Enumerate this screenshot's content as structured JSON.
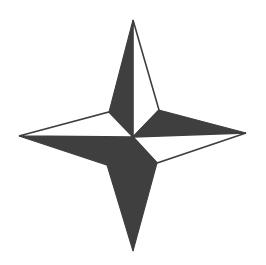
{
  "figure": {
    "title": "Four-Pointed Compass Star",
    "background_color": "#ffffff",
    "ink_color": "#3f3f3f",
    "outline_color": "#3f3f3f",
    "highlight_color": "#ffffff",
    "canvas": {
      "width": 266,
      "height": 265
    }
  },
  "geometry": {
    "center": {
      "x": 133,
      "y": 137
    },
    "points": 4,
    "tips": [
      {
        "name": "north",
        "x": 133,
        "y": 20,
        "label": "N"
      },
      {
        "name": "east",
        "x": 246,
        "y": 133,
        "label": "E"
      },
      {
        "name": "south",
        "x": 133,
        "y": 251,
        "label": "S"
      },
      {
        "name": "west",
        "x": 19,
        "y": 136,
        "label": "W"
      }
    ],
    "inner_vertices": [
      {
        "name": "northeast",
        "x": 159,
        "y": 110
      },
      {
        "name": "southeast",
        "x": 157,
        "y": 163
      },
      {
        "name": "southwest",
        "x": 107,
        "y": 165
      },
      {
        "name": "northwest",
        "x": 109,
        "y": 112
      }
    ],
    "facets": [
      {
        "arm": "north",
        "side": "west",
        "fill": "dark",
        "path": "M 133 20 L 109 112 L 133 137 Z"
      },
      {
        "arm": "north",
        "side": "east",
        "fill": "light",
        "path": "M 133 20 L 133 137 L 159 110 Z"
      },
      {
        "arm": "east",
        "side": "north",
        "fill": "dark",
        "path": "M 246 133 L 159 110 L 133 137 Z"
      },
      {
        "arm": "east",
        "side": "south",
        "fill": "light",
        "path": "M 246 133 L 133 137 L 157 163 Z"
      },
      {
        "arm": "south",
        "side": "east",
        "fill": "dark",
        "path": "M 133 251 L 157 163 L 133 137 Z"
      },
      {
        "arm": "south",
        "side": "west",
        "fill": "dark",
        "path": "M 133 251 L 133 137 L 107 165 Z"
      },
      {
        "arm": "west",
        "side": "south",
        "fill": "dark",
        "path": "M 19 136 L 107 165 L 133 137 Z"
      },
      {
        "arm": "west",
        "side": "north",
        "fill": "light",
        "path": "M 19 136 L 133 137 L 109 112 Z"
      }
    ]
  }
}
